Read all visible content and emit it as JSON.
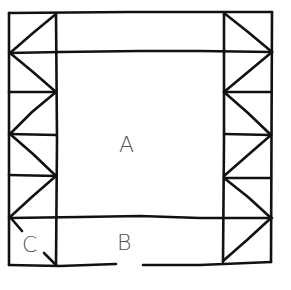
{
  "diagram": {
    "type": "floor-plan-sketch",
    "stroke_color": "#111111",
    "label_color": "#555555",
    "background": "#ffffff",
    "labels": {
      "A": "A",
      "B": "B",
      "C": "C"
    },
    "regions": [
      {
        "id": "A",
        "label": "A",
        "role": "central open space"
      },
      {
        "id": "B",
        "label": "B",
        "role": "bottom strip with entrance opening"
      },
      {
        "id": "C",
        "label": "C",
        "role": "bottom-left corner bay"
      }
    ],
    "left_truss": {
      "panels": 5,
      "pattern": "zigzag"
    },
    "right_truss": {
      "panels": 6,
      "pattern": "zigzag"
    },
    "bottom_opening": "gap in bottom wall between B region"
  }
}
